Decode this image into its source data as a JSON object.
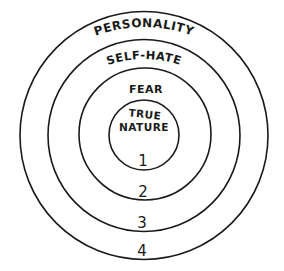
{
  "diagram": {
    "type": "concentric-circles",
    "layers": [
      {
        "number": "1",
        "label_line1": "TRUE",
        "label_line2": "NATURE"
      },
      {
        "number": "2",
        "label": "FEAR"
      },
      {
        "number": "3",
        "label": "SELF-HATE"
      },
      {
        "number": "4",
        "label": "PERSONALITY"
      }
    ],
    "colors": {
      "stroke": "#1a1a1a",
      "background": "#ffffff"
    }
  }
}
